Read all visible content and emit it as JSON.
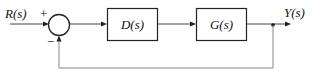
{
  "diagram": {
    "type": "feedback-control-block-diagram",
    "input": {
      "label": "R(s)",
      "sign": "+"
    },
    "summing_junction": {
      "feedback_sign": "−"
    },
    "blocks": [
      {
        "id": "controller",
        "label": "D(s)"
      },
      {
        "id": "plant",
        "label": "G(s)"
      }
    ],
    "output": {
      "label": "Y(s)"
    },
    "feedback": {
      "type": "unity",
      "sign": "negative"
    },
    "colors": {
      "lines": "#444444",
      "feedback_line": "#888888",
      "text": "#111111",
      "background": "#ffffff"
    }
  }
}
